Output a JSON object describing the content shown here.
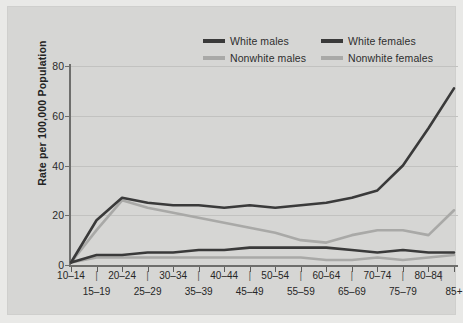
{
  "chart_data": {
    "type": "line",
    "title": "",
    "xlabel": "",
    "ylabel": "Rate per 100,000 Population",
    "ylim": [
      0,
      80
    ],
    "yticks": [
      0,
      20,
      40,
      60,
      80
    ],
    "grid": true,
    "legend_position": "top-center",
    "categories": [
      "10–14",
      "15–19",
      "20–24",
      "25–29",
      "30–34",
      "35–39",
      "40–44",
      "45–49",
      "50–54",
      "55–59",
      "60–64",
      "65–69",
      "70–74",
      "75–79",
      "80–84",
      "85+"
    ],
    "categories_top_row": [
      "10–14",
      "20–24",
      "30–34",
      "40–44",
      "50–54",
      "60–64",
      "70–74",
      "80–84"
    ],
    "categories_bottom_row": [
      "15–19",
      "25–29",
      "35–39",
      "45–49",
      "55–59",
      "65–69",
      "75–79",
      "85+"
    ],
    "series": [
      {
        "name": "White males",
        "color": "#3a3a3a",
        "values": [
          1,
          18,
          27,
          25,
          24,
          24,
          23,
          24,
          23,
          24,
          25,
          27,
          30,
          40,
          55,
          71
        ]
      },
      {
        "name": "Nonwhite males",
        "color": "#a9a9a7",
        "values": [
          1,
          14,
          26,
          23,
          21,
          19,
          17,
          15,
          13,
          10,
          9,
          12,
          14,
          14,
          12,
          22
        ]
      },
      {
        "name": "White females",
        "color": "#3a3a3a",
        "values": [
          1,
          4,
          4,
          5,
          5,
          6,
          6,
          7,
          7,
          7,
          7,
          6,
          5,
          6,
          5,
          5
        ]
      },
      {
        "name": "Nonwhite females",
        "color": "#a9a9a7",
        "values": [
          1,
          3,
          3,
          3,
          3,
          3,
          3,
          3,
          3,
          3,
          2,
          2,
          3,
          2,
          3,
          4
        ]
      }
    ]
  },
  "legend": {
    "items": [
      {
        "label": "White males",
        "swatch": "dark"
      },
      {
        "label": "White females",
        "swatch": "dark"
      },
      {
        "label": "Nonwhite males",
        "swatch": "light"
      },
      {
        "label": "Nonwhite females",
        "swatch": "light"
      }
    ]
  },
  "axis": {
    "y_title": "Rate per 100,000 Population",
    "y_tick_labels": [
      "0",
      "20",
      "40",
      "60",
      "80"
    ]
  },
  "colors": {
    "background": "#d6d6d4",
    "page": "#e9e9e7",
    "series_dark": "#3a3a3a",
    "series_light": "#a9a9a7",
    "axis": "#6e6e6c",
    "grid": "#c2c2c0"
  }
}
